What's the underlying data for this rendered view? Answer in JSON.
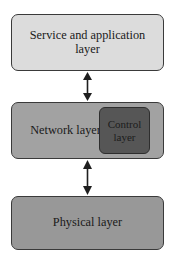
{
  "diagram": {
    "layers": [
      {
        "id": "service",
        "label": "Service and application layer",
        "fill": "#dcdcdc"
      },
      {
        "id": "network",
        "label": "Network layer",
        "fill": "#a2a2a2",
        "nested": {
          "id": "control",
          "label": "Control layer",
          "fill": "#565656"
        }
      },
      {
        "id": "physical",
        "label": "Physical layer",
        "fill": "#989898"
      }
    ],
    "connectors": [
      {
        "id": "service-network",
        "icon": "double-headed-vertical-arrow",
        "from": "Service and application layer",
        "to": "Network layer"
      },
      {
        "id": "network-physical",
        "icon": "double-headed-vertical-arrow",
        "from": "Network layer",
        "to": "Physical layer"
      }
    ],
    "colors": {
      "outline": "#3a3a3a",
      "background": "#ffffff",
      "text": "#1a1a1a"
    }
  }
}
